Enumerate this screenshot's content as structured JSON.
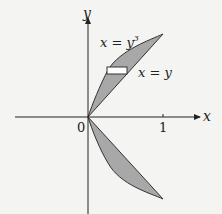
{
  "diagram": {
    "axes": {
      "x_label": "x",
      "y_label": "y",
      "origin_label": "0",
      "x_tick_label": "1"
    },
    "curves": [
      {
        "label_base": "x = y",
        "label_exp": "3",
        "equation": "x = y^3"
      },
      {
        "label": "x = y",
        "equation": "x = y"
      }
    ],
    "region": {
      "fill": "#a8a8a8",
      "stroke": "#333333",
      "description": "Region between x=y and x=y^3 for -1<=y<=1 with horizontal strip element"
    }
  }
}
